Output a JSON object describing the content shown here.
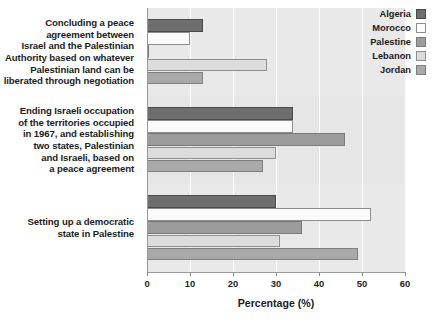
{
  "chart_data": {
    "type": "bar",
    "orientation": "horizontal",
    "title": "",
    "subtitle": "",
    "xlabel": "Percentage (%)",
    "ylabel": "",
    "xlim": [
      0,
      60
    ],
    "xticks": [
      0,
      10,
      20,
      30,
      40,
      50,
      60
    ],
    "xtick_labels": [
      "0",
      "10",
      "20",
      "30",
      "40",
      "50",
      "60"
    ],
    "grid": true,
    "grid_axis": "x",
    "legend_position": "top-right",
    "categories": [
      "Concluding a peace agreement between Israel and the Palestinian Authority based on whatever Palestinian land can be liberated through negotiation",
      "Ending Israeli occupation of the territories occupied in 1967, and establishing two states, Palestinian and Israeli, based on a peace agreement",
      "Setting up a democratic state in Palestine"
    ],
    "category_lines": [
      [
        "Concluding a peace",
        "agreement between",
        "Israel and the Palestinian",
        "Authority based on whatever",
        "Palestinian land can be",
        "liberated through negotiation"
      ],
      [
        "Ending Israeli occupation",
        "of the territories occupied",
        "in 1967, and establishing",
        "two states, Palestinian",
        "and Israeli, based on",
        "a peace agreement"
      ],
      [
        "Setting up a democratic",
        "state in Palestine"
      ]
    ],
    "series": [
      {
        "name": "Algeria",
        "color": "#6e6e6e",
        "border": "#4a4a4a",
        "values": [
          13,
          34,
          30
        ]
      },
      {
        "name": "Morocco",
        "color": "#fbfbfb",
        "border": "#8e8e8e",
        "values": [
          10,
          34,
          52
        ]
      },
      {
        "name": "Palestine",
        "color": "#9c9c9c",
        "border": "#7a7a7a",
        "values": [
          0.5,
          46,
          36
        ]
      },
      {
        "name": "Lebanon",
        "color": "#dcdcdc",
        "border": "#8e8e8e",
        "values": [
          28,
          30,
          31
        ]
      },
      {
        "name": "Jordan",
        "color": "#a9a9a9",
        "border": "#7f7f7f",
        "values": [
          13,
          27,
          49
        ]
      }
    ]
  },
  "legend": {
    "items": [
      {
        "label": "Algeria"
      },
      {
        "label": "Morocco"
      },
      {
        "label": "Palestine"
      },
      {
        "label": "Lebanon"
      },
      {
        "label": "Jordan"
      }
    ]
  },
  "axis": {
    "x_title": "Percentage (%)"
  }
}
